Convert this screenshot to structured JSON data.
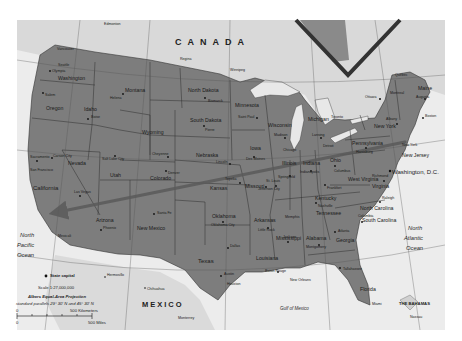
{
  "map": {
    "title": "United States",
    "colors": {
      "background": "#ffffff",
      "frame_bg": "#ebebeb",
      "us_land": "#7d7d7d",
      "foreign_land": "#d9d9d9",
      "water": "#f0f0f0",
      "lakes": "#e8e8e8",
      "borders": "#3a3a3a",
      "arrow": "#5a5a5a",
      "inset_frame": "#333333"
    },
    "countries": {
      "canada": "CANADA",
      "mexico": "MEXICO",
      "bahamas": "THE BAHAMAS"
    },
    "oceans": {
      "pacific": [
        "North",
        "Pacific",
        "Ocean"
      ],
      "atlantic": [
        "North",
        "Atlantic",
        "Ocean"
      ],
      "gulf": "Gulf of Mexico"
    },
    "states": {
      "washington": "Washington",
      "oregon": "Oregon",
      "california": "California",
      "nevada": "Nevada",
      "idaho": "Idaho",
      "montana": "Montana",
      "wyoming": "Wyoming",
      "utah": "Utah",
      "arizona": "Arizona",
      "colorado": "Colorado",
      "new_mexico": "New Mexico",
      "north_dakota": "North Dakota",
      "south_dakota": "South Dakota",
      "nebraska": "Nebraska",
      "kansas": "Kansas",
      "oklahoma": "Oklahoma",
      "texas": "Texas",
      "minnesota": "Minnesota",
      "iowa": "Iowa",
      "missouri": "Missouri",
      "arkansas": "Arkansas",
      "louisiana": "Louisiana",
      "wisconsin": "Wisconsin",
      "illinois": "Illinois",
      "michigan": "Michigan",
      "indiana": "Indiana",
      "ohio": "Ohio",
      "kentucky": "Kentucky",
      "tennessee": "Tennessee",
      "mississippi": "Mississippi",
      "alabama": "Alabama",
      "georgia": "Georgia",
      "florida": "Florida",
      "south_carolina": "South Carolina",
      "north_carolina": "North Carolina",
      "virginia": "Virginia",
      "west_virginia": "West Virginia",
      "pennsylvania": "Pennsylvania",
      "new_york": "New York",
      "maine": "Maine",
      "new_jersey": "New Jersey"
    },
    "cities": {
      "edmonton": "Edmonton",
      "regina": "Regina",
      "winnipeg": "Winnipeg",
      "vancouver": "Vancouver",
      "seattle": "Seattle",
      "olympia": "Olympia",
      "salem": "Salem",
      "boise": "Boise",
      "helena": "Helena",
      "bismarck": "Bismarck",
      "pierre": "Pierre",
      "cheyenne": "Cheyenne",
      "denver": "Denver",
      "lincoln": "Lincoln",
      "topeka": "Topeka",
      "salt_lake_city": "Salt Lake City",
      "carson_city": "Carson City",
      "sacramento": "Sacramento",
      "san_francisco": "San Francisco",
      "las_vegas": "Las Vegas",
      "los_angeles": "Los Angeles",
      "phoenix": "Phoenix",
      "santa_fe": "Santa Fe",
      "oklahoma_city": "Oklahoma City",
      "dallas": "Dallas",
      "austin": "Austin",
      "houston": "Houston",
      "saint_paul": "Saint Paul",
      "des_moines": "Des Moines",
      "jefferson_city": "Jefferson City",
      "st_louis": "St. Louis",
      "little_rock": "Little Rock",
      "baton_rouge": "Baton Rouge",
      "new_orleans": "New Orleans",
      "madison": "Madison",
      "chicago": "Chicago",
      "springfield": "Springfield",
      "lansing": "Lansing",
      "detroit": "Detroit",
      "indianapolis": "Indianapolis",
      "columbus": "Columbus",
      "frankfort": "Frankfort",
      "nashville": "Nashville",
      "memphis": "Memphis",
      "jackson": "Jackson",
      "montgomery": "Montgomery",
      "atlanta": "Atlanta",
      "tallahassee": "Tallahassee",
      "miami": "Miami",
      "columbia": "Columbia",
      "raleigh": "Raleigh",
      "richmond": "Richmond",
      "washington_dc": "Washington, D.C.",
      "harrisburg": "Harrisburg",
      "albany": "Albany",
      "new_york": "New York",
      "toronto": "Toronto",
      "ottawa": "Ottawa",
      "montreal": "Montreal",
      "quebec": "Québec",
      "augusta": "Augusta",
      "boston": "Boston",
      "hermosillo": "Hermosillo",
      "chihuahua": "Chihuahua",
      "monterrey": "Monterrey",
      "mexicali": "Mexicali",
      "nassau": "Nassau"
    },
    "legend": {
      "capital_label": "State capital",
      "scale": "Scale 1:27,000,000",
      "projection": "Albers Equal-Area Projection",
      "parallels": "standard parallels 29° 30' N and 45° 30' N",
      "km_zero": "0",
      "km_label": "500 Kilometers",
      "mi_zero": "0",
      "mi_label": "500 Miles"
    },
    "annotation": {
      "arrow": {
        "description": "Arrow from Washington, D.C. area pointing to Southern California",
        "from": [
          405,
          142
        ],
        "to": [
          55,
          213
        ]
      }
    }
  }
}
